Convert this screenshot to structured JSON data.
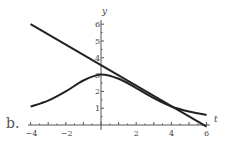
{
  "panel_label": "b.",
  "chart_data": {
    "type": "line",
    "title": "",
    "xlabel": "t",
    "ylabel": "y",
    "xlim": [
      -4,
      6
    ],
    "ylim": [
      0,
      6
    ],
    "x_ticks": [
      "-4",
      "-2",
      "2",
      "4",
      "6"
    ],
    "y_ticks": [
      "1",
      "2",
      "3",
      "4",
      "5",
      "6"
    ],
    "grid": false,
    "series": [
      {
        "name": "curve",
        "x": [
          -4,
          -3,
          -2,
          -1,
          0,
          1,
          2,
          3,
          4,
          5,
          6
        ],
        "y": [
          1.1,
          1.45,
          2.0,
          2.65,
          3.0,
          2.75,
          2.2,
          1.6,
          1.1,
          0.8,
          0.6
        ]
      },
      {
        "name": "tangent-line",
        "x": [
          -4,
          6
        ],
        "y": [
          6.0,
          -0.1
        ]
      }
    ]
  }
}
